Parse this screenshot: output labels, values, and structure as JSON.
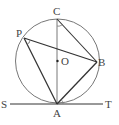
{
  "diagram": {
    "type": "geometry",
    "colors": {
      "circle": "#777777",
      "line": "#333333",
      "angle_mark": "#666666",
      "label": "#444444"
    },
    "points": {
      "C": {
        "label": "C",
        "x": 57,
        "y": 19
      },
      "P": {
        "label": "P",
        "x": 24,
        "y": 38
      },
      "O": {
        "label": "O",
        "x": 57.5,
        "y": 61
      },
      "B": {
        "label": "B",
        "x": 97,
        "y": 62
      },
      "A": {
        "label": "A",
        "x": 57,
        "y": 104
      },
      "S": {
        "label": "S",
        "x": 10,
        "y": 104
      },
      "T": {
        "label": "T",
        "x": 103,
        "y": 104
      }
    },
    "circle": {
      "center": "O",
      "radius": 42
    },
    "segments": [
      "CA",
      "PA",
      "PB",
      "AB",
      "CB",
      "ST"
    ],
    "angle_marks": [
      "angle PCB at C",
      "angle APB at P",
      "angle BAT at A"
    ]
  }
}
